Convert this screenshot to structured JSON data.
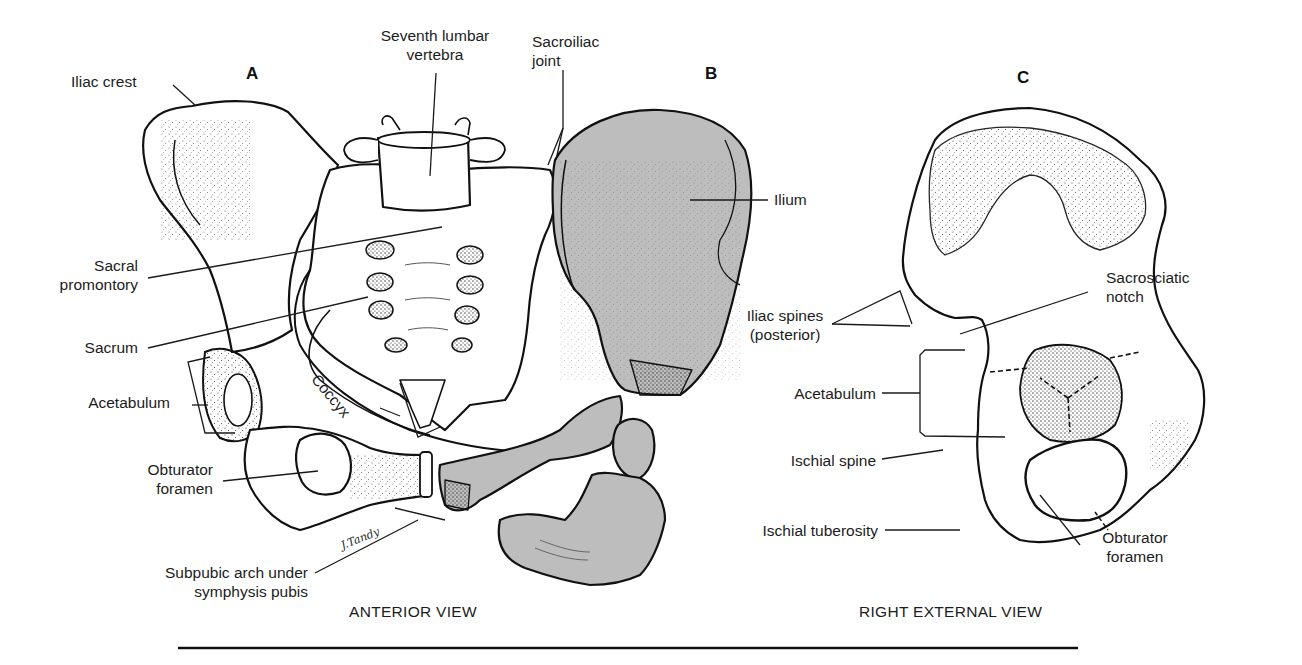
{
  "figure": {
    "panels": [
      {
        "id": "A",
        "label": "A"
      },
      {
        "id": "B",
        "label": "B"
      },
      {
        "id": "C",
        "label": "C"
      }
    ],
    "views": {
      "anterior": "ANTERIOR VIEW",
      "right_external": "RIGHT EXTERNAL VIEW"
    },
    "signature": "J.Tandy",
    "colors": {
      "line": "#111111",
      "bone_fill": "#ffffff",
      "shaded_bone_fill": "#bdbdbd",
      "stipple": "#333333"
    }
  },
  "labels_anterior": {
    "iliac_crest": "Iliac crest",
    "seventh_lumbar_1": "Seventh lumbar",
    "seventh_lumbar_2": "vertebra",
    "sacroiliac_1": "Sacroiliac",
    "sacroiliac_2": "joint",
    "ilium": "Ilium",
    "sacral_promontory_1": "Sacral",
    "sacral_promontory_2": "promontory",
    "sacrum": "Sacrum",
    "coccyx": "Coccyx",
    "acetabulum": "Acetabulum",
    "obturator_1": "Obturator",
    "obturator_2": "foramen",
    "subpubic_1": "Subpubic arch under",
    "subpubic_2": "symphysis pubis"
  },
  "labels_lateral": {
    "iliac_spines_1": "Iliac spines",
    "iliac_spines_2": "(posterior)",
    "sacrosciatic_1": "Sacrosciatic",
    "sacrosciatic_2": "notch",
    "acetabulum": "Acetabulum",
    "ischial_spine": "Ischial spine",
    "ischial_tuberosity": "Ischial tuberosity",
    "obturator_1": "Obturator",
    "obturator_2": "foramen"
  }
}
